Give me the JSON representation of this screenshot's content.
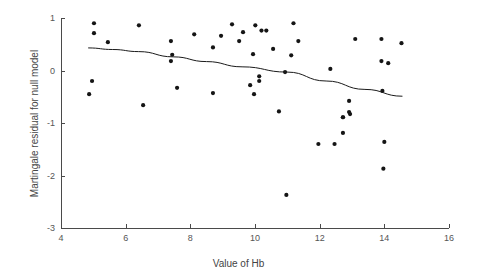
{
  "chart_data": {
    "type": "scatter",
    "title": "",
    "xlabel": "Value of Hb",
    "ylabel": "Martingale residual for null model",
    "xlim": [
      4,
      16
    ],
    "ylim": [
      -3,
      1
    ],
    "xticks": [
      4,
      6,
      8,
      10,
      12,
      14,
      16
    ],
    "yticks": [
      1,
      0,
      -1,
      -2,
      -3
    ],
    "xtick_labels": [
      "4",
      "6",
      "8",
      "10",
      "12",
      "14",
      "16"
    ],
    "ytick_labels": [
      "1",
      "0",
      "-1",
      "-2",
      "-3"
    ],
    "grid": false,
    "legend": false,
    "series": [
      {
        "name": "Martingale residuals",
        "marker": "filled-circle",
        "color": "#151515",
        "points": [
          [
            5.02,
            0.9
          ],
          [
            5.02,
            0.71
          ],
          [
            5.45,
            0.54
          ],
          [
            6.41,
            0.86
          ],
          [
            7.4,
            0.56
          ],
          [
            7.44,
            0.3
          ],
          [
            7.4,
            0.18
          ],
          [
            4.96,
            -0.2
          ],
          [
            4.87,
            -0.45
          ],
          [
            6.54,
            -0.66
          ],
          [
            7.59,
            -0.33
          ],
          [
            8.12,
            0.69
          ],
          [
            8.95,
            0.66
          ],
          [
            9.29,
            0.88
          ],
          [
            9.63,
            0.73
          ],
          [
            10.01,
            0.86
          ],
          [
            10.2,
            0.76
          ],
          [
            10.35,
            0.76
          ],
          [
            11.19,
            0.9
          ],
          [
            11.34,
            0.56
          ],
          [
            8.7,
            0.44
          ],
          [
            9.51,
            0.56
          ],
          [
            10.56,
            0.41
          ],
          [
            9.94,
            0.31
          ],
          [
            11.12,
            0.29
          ],
          [
            10.93,
            -0.03
          ],
          [
            10.13,
            -0.11
          ],
          [
            9.85,
            -0.28
          ],
          [
            10.13,
            -0.2
          ],
          [
            9.97,
            -0.45
          ],
          [
            8.7,
            -0.43
          ],
          [
            10.74,
            -0.78
          ],
          [
            13.1,
            0.6
          ],
          [
            13.91,
            0.6
          ],
          [
            14.53,
            0.52
          ],
          [
            13.91,
            0.18
          ],
          [
            14.12,
            0.14
          ],
          [
            12.33,
            0.03
          ],
          [
            13.94,
            -0.39
          ],
          [
            12.91,
            -0.58
          ],
          [
            12.91,
            -0.79
          ],
          [
            12.72,
            -0.89
          ],
          [
            12.72,
            -0.89
          ],
          [
            12.94,
            -0.83
          ],
          [
            12.72,
            -1.19
          ],
          [
            11.96,
            -1.4
          ],
          [
            12.46,
            -1.4
          ],
          [
            14.0,
            -1.36
          ],
          [
            13.97,
            -1.87
          ],
          [
            10.97,
            -2.37
          ]
        ]
      }
    ],
    "fit_curve": {
      "name": "smoothed fit",
      "color": "#1a1a1a",
      "points": [
        [
          4.84,
          0.43
        ],
        [
          5.6,
          0.4
        ],
        [
          6.4,
          0.36
        ],
        [
          7.47,
          0.26
        ],
        [
          8.5,
          0.17
        ],
        [
          9.6,
          0.07
        ],
        [
          10.99,
          -0.03
        ],
        [
          12.2,
          -0.2
        ],
        [
          13.4,
          -0.36
        ],
        [
          14.56,
          -0.49
        ]
      ]
    }
  }
}
